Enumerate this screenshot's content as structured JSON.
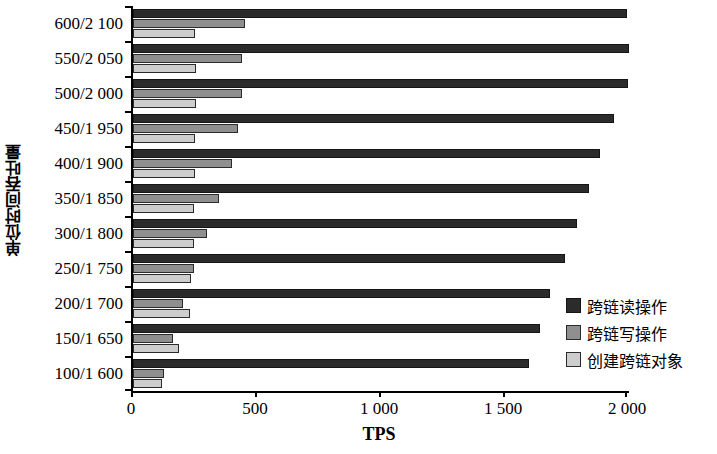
{
  "chart_data": {
    "type": "bar",
    "orientation": "horizontal",
    "title": "",
    "xlabel": "TPS",
    "ylabel": "单位时间吞吐量",
    "xlim": [
      0,
      2000
    ],
    "xticks": [
      0,
      500,
      1000,
      1500,
      2000
    ],
    "xtick_labels": [
      "0",
      "500",
      "1 000",
      "1 500",
      "2 000"
    ],
    "grid": false,
    "legend_position": "right-lower",
    "categories": [
      "600/2 100",
      "550/2 050",
      "500/2 000",
      "450/1 950",
      "400/1 900",
      "350/1 850",
      "300/1 800",
      "250/1 750",
      "200/1 700",
      "150/1 650",
      "100/1 600"
    ],
    "series": [
      {
        "name": "跨链读操作",
        "color": "#2b2b2b",
        "values": [
          1990,
          2010,
          1995,
          1940,
          1885,
          1840,
          1790,
          1740,
          1680,
          1640,
          1595
        ]
      },
      {
        "name": "跨链写操作",
        "color": "#8f8f8f",
        "values": [
          450,
          440,
          440,
          425,
          400,
          345,
          300,
          245,
          200,
          160,
          125
        ]
      },
      {
        "name": "创建跨链对象",
        "color": "#cdcdcd",
        "values": [
          250,
          255,
          255,
          250,
          250,
          245,
          245,
          235,
          230,
          185,
          115
        ]
      }
    ]
  },
  "axis": {
    "x_title": "TPS",
    "y_title": "单位时间吞吐量"
  }
}
